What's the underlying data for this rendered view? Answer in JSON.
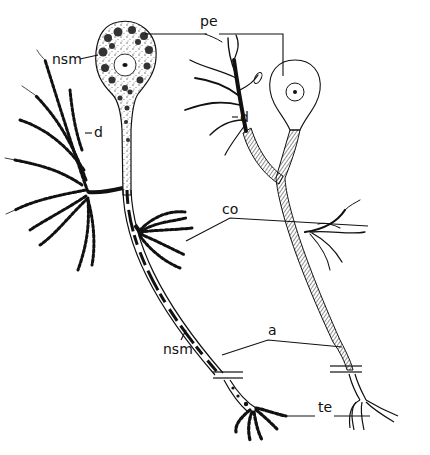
{
  "figure": {
    "colors": {
      "ink": "#111111",
      "background": "#ffffff"
    }
  },
  "labels": {
    "pe": "pe",
    "nsm_top": "nsm",
    "d_left": "d",
    "d_right": "d",
    "co": "co",
    "a": "a",
    "nsm_bottom": "nsm",
    "te": "te"
  },
  "structures": [
    {
      "key": "pe",
      "meaning": "perikaryon",
      "targets": [
        "left-soma",
        "right-soma"
      ]
    },
    {
      "key": "nsm",
      "meaning": "neurosecretory material",
      "targets": [
        "left-soma-granules",
        "left-axon-granules"
      ]
    },
    {
      "key": "d",
      "meaning": "dendrites",
      "targets": [
        "left-dendrites",
        "right-dendrites"
      ]
    },
    {
      "key": "co",
      "meaning": "collaterals",
      "targets": [
        "left-collateral",
        "right-collateral"
      ]
    },
    {
      "key": "a",
      "meaning": "axon",
      "targets": [
        "left-axon",
        "right-axon"
      ]
    },
    {
      "key": "te",
      "meaning": "terminals",
      "targets": [
        "left-terminal",
        "right-terminal"
      ]
    }
  ]
}
